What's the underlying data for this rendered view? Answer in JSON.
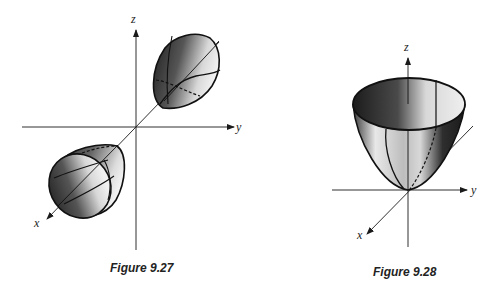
{
  "figures": [
    {
      "caption": "Figure 9.27",
      "description": "Elliptic paraboloid of two sheets (hyperboloid-like) opening along the x-axis",
      "axes": {
        "x": "x",
        "y": "y",
        "z": "z"
      }
    },
    {
      "caption": "Figure 9.28",
      "description": "Elliptic paraboloid opening upward along the z-axis",
      "axes": {
        "x": "x",
        "y": "y",
        "z": "z"
      }
    }
  ],
  "colors": {
    "ink": "#1a1a1a",
    "background": "#ffffff"
  }
}
